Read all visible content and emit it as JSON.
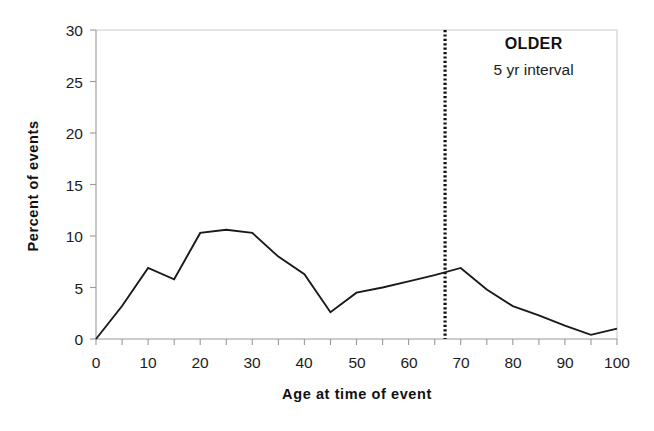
{
  "chart_data": {
    "type": "line",
    "title": "",
    "xlabel": "Age at time of event",
    "ylabel": "Percent of events",
    "xlim": [
      0,
      100
    ],
    "ylim": [
      0,
      30
    ],
    "grid": false,
    "legend": "none",
    "x_tick_labels": [
      "0",
      "10",
      "20",
      "30",
      "40",
      "50",
      "60",
      "70",
      "80",
      "90",
      "100"
    ],
    "x_tick_values": [
      0,
      10,
      20,
      30,
      40,
      50,
      60,
      70,
      80,
      90,
      100
    ],
    "x_minor_tick_step": 5,
    "y_tick_labels": [
      "0",
      "5",
      "10",
      "15",
      "20",
      "25",
      "30"
    ],
    "y_tick_values": [
      0,
      5,
      10,
      15,
      20,
      25,
      30
    ],
    "series": [
      {
        "name": "Percent of events",
        "color": "#1a1a1a",
        "x": [
          0,
          5,
          10,
          15,
          20,
          25,
          30,
          35,
          40,
          45,
          50,
          55,
          60,
          65,
          70,
          75,
          80,
          85,
          90,
          95,
          100
        ],
        "values": [
          0.0,
          3.2,
          6.9,
          5.8,
          10.3,
          10.6,
          10.3,
          8.0,
          6.3,
          2.6,
          4.5,
          5.0,
          5.6,
          6.2,
          6.9,
          4.8,
          3.2,
          2.3,
          1.3,
          0.4,
          1.0
        ]
      }
    ],
    "annotations": [
      {
        "name": "older-label",
        "text": "OLDER",
        "bold": true,
        "x": 84,
        "y": 28.2
      },
      {
        "name": "interval-label",
        "text": "5 yr interval",
        "bold": false,
        "x": 84,
        "y": 25.6
      }
    ],
    "reference_lines": [
      {
        "name": "older-cutoff-line",
        "orientation": "vertical",
        "x": 67,
        "style": "dotted",
        "color": "#111111"
      }
    ]
  }
}
